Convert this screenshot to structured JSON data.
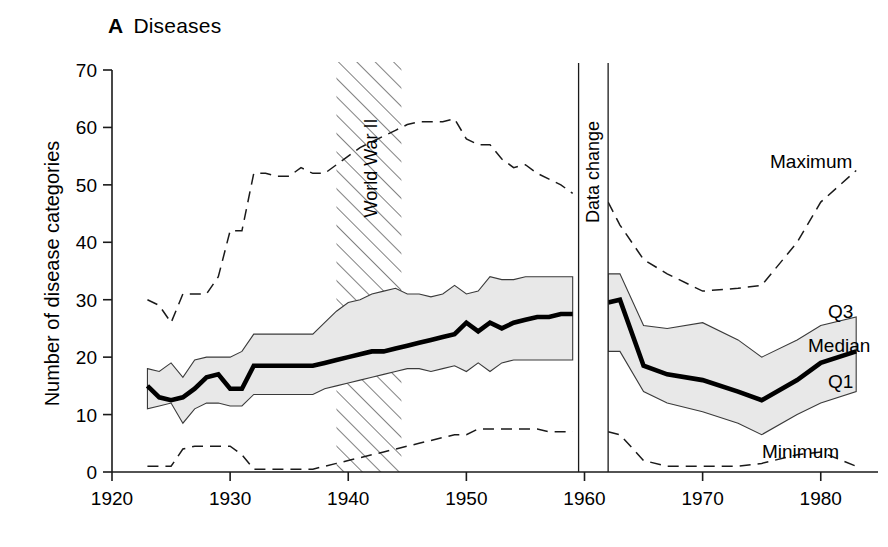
{
  "panel": {
    "letter": "A",
    "title": "Diseases"
  },
  "axes": {
    "y_title": "Number of disease categories",
    "y_ticks": [
      0,
      10,
      20,
      30,
      40,
      50,
      60,
      70
    ],
    "y_min": 0,
    "y_max": 70,
    "x_ticks": [
      1920,
      1930,
      1940,
      1950,
      1960,
      1970,
      1980
    ],
    "x_min": 1920,
    "x_max": 1984
  },
  "annotations": [
    {
      "name": "world-war-ii",
      "label": "World War II",
      "type": "hatched-band",
      "x_start": 1939,
      "x_end": 1944.5
    },
    {
      "name": "data-change",
      "label": "Data change",
      "type": "gap",
      "x_start": 1959.5,
      "x_end": 1962
    }
  ],
  "series_labels": {
    "maximum": "Maximum",
    "q3": "Q3",
    "median": "Median",
    "q1": "Q1",
    "minimum": "Minimum"
  },
  "chart_data": {
    "type": "line",
    "title": "Diseases",
    "xlabel": "",
    "ylabel": "Number of disease categories",
    "xlim": [
      1920,
      1984
    ],
    "ylim": [
      0,
      70
    ],
    "grid": false,
    "legend": "inline-right-labels",
    "notes": [
      "Hatched vertical band marks World War II (1939-1944.5).",
      "Vertical gap at 1959.5-1962 marks a change in the underlying data (Data change).",
      "Shaded grey band between Q1 and Q3 is the interquartile range.",
      "Maximum and Minimum drawn as dashed lines."
    ],
    "x": [
      1923,
      1924,
      1925,
      1926,
      1927,
      1928,
      1929,
      1930,
      1931,
      1932,
      1933,
      1934,
      1935,
      1936,
      1937,
      1938,
      1939,
      1940,
      1941,
      1942,
      1943,
      1944,
      1945,
      1946,
      1947,
      1948,
      1949,
      1950,
      1951,
      1952,
      1953,
      1954,
      1955,
      1956,
      1957,
      1958,
      1959,
      1962,
      1963,
      1965,
      1967,
      1970,
      1973,
      1975,
      1978,
      1980,
      1983
    ],
    "series": [
      {
        "name": "Maximum",
        "values": [
          30,
          29,
          26,
          31,
          31,
          31,
          34,
          42,
          42,
          52,
          52,
          51.5,
          51.5,
          53,
          52,
          52,
          53.5,
          55,
          56.5,
          57.5,
          58.5,
          59.5,
          60.5,
          61,
          61,
          61,
          61.5,
          58,
          57,
          57,
          54.5,
          53,
          53.5,
          52,
          51,
          50,
          48.5,
          47,
          43,
          37,
          34.5,
          31.5,
          32,
          32.5,
          40,
          47,
          52.5
        ]
      },
      {
        "name": "Q3",
        "values": [
          18,
          17.5,
          19,
          16.5,
          19.5,
          20,
          20,
          20,
          21,
          24,
          24,
          24,
          24,
          24,
          24,
          26,
          28,
          29.5,
          30,
          31,
          31.5,
          32,
          31,
          31,
          30.5,
          31,
          32.5,
          31,
          31.5,
          34,
          33.5,
          33.5,
          34,
          34,
          34,
          34,
          34,
          34.5,
          34.5,
          25.5,
          25,
          26,
          23,
          20,
          23,
          25.5,
          27
        ]
      },
      {
        "name": "Median",
        "values": [
          15,
          13,
          12.5,
          13,
          14.5,
          16.5,
          17,
          14.5,
          14.5,
          18.5,
          18.5,
          18.5,
          18.5,
          18.5,
          18.5,
          19,
          19.5,
          20,
          20.5,
          21,
          21,
          21.5,
          22,
          22.5,
          23,
          23.5,
          24,
          26,
          24.5,
          26,
          25,
          26,
          26.5,
          27,
          27,
          27.5,
          27.5,
          29.5,
          30,
          18.5,
          17,
          16,
          14,
          12.5,
          16,
          19,
          21
        ]
      },
      {
        "name": "Q1",
        "values": [
          11,
          11.5,
          12,
          8.5,
          11,
          12,
          12,
          11.5,
          11.5,
          13.5,
          13.5,
          13.5,
          13.5,
          13.5,
          13.5,
          14.5,
          15,
          15.5,
          16,
          16.5,
          17,
          17.5,
          18,
          18,
          17.5,
          18,
          18.5,
          17.5,
          19,
          17.5,
          19,
          19.5,
          19.5,
          19.5,
          19.5,
          19.5,
          19.5,
          21,
          21,
          14,
          12,
          10.5,
          8.5,
          6.5,
          10,
          12,
          14
        ]
      },
      {
        "name": "Minimum",
        "values": [
          1,
          1,
          1,
          4,
          4.5,
          4.5,
          4.5,
          4.5,
          3,
          0.5,
          0.5,
          0.5,
          0.5,
          0.5,
          0.5,
          1,
          1.5,
          2,
          2.5,
          3,
          3.5,
          4,
          4.5,
          5,
          5.5,
          6,
          6.5,
          6.5,
          7.5,
          7.5,
          7.5,
          7.5,
          7.5,
          7.5,
          7,
          7,
          7,
          7,
          6.5,
          2,
          1,
          1,
          1,
          1.5,
          3,
          3.5,
          1
        ]
      }
    ]
  }
}
